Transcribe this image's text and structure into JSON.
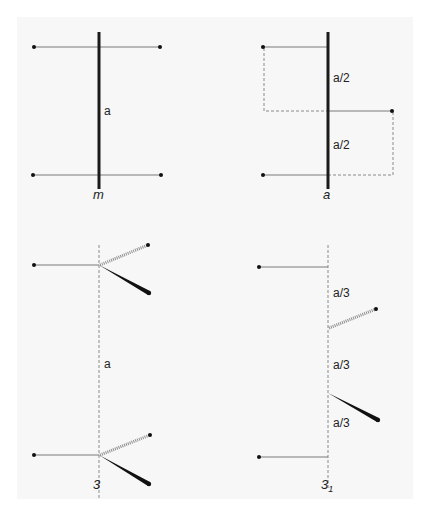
{
  "diagram": {
    "panels": [
      {
        "id": "panel-m",
        "axis_label": "m",
        "axis_style": "solid-thick",
        "segment_labels": [
          "a"
        ]
      },
      {
        "id": "panel-a",
        "axis_label": "a",
        "axis_style": "solid-thick",
        "segment_labels": [
          "a/2",
          "a/2"
        ]
      },
      {
        "id": "panel-3",
        "axis_label": "3",
        "axis_style": "dashed",
        "segment_labels": [
          "a"
        ]
      },
      {
        "id": "panel-3-1",
        "axis_label": "3",
        "axis_label_subscript": "1",
        "axis_style": "dashed",
        "segment_labels": [
          "a/3",
          "a/3",
          "a/3"
        ]
      }
    ],
    "colors": {
      "background": "#ffffff",
      "panel": "#f7f7f7",
      "thin_line": "#7a7a7a",
      "thick_line": "#1a1a1a",
      "dashed_line": "#8a8a8a"
    }
  }
}
